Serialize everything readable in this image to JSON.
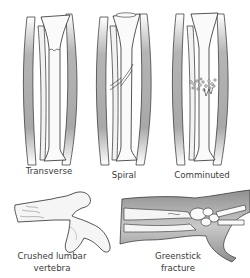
{
  "diagram": {
    "colors": {
      "muscle": "#8a8a8a",
      "muscle_light": "#e6e6e6",
      "bone": "#f7f7f7",
      "outline": "#2b2b2b",
      "text": "#3a3a3a"
    },
    "panels": [
      {
        "id": "transverse",
        "label": "Transverse"
      },
      {
        "id": "spiral",
        "label": "Spiral"
      },
      {
        "id": "comminuted",
        "label": "Comminuted"
      },
      {
        "id": "crushed-lumbar-vertebra",
        "label_line1": "Crushed lumbar",
        "label_line2": "vertebra"
      },
      {
        "id": "greenstick",
        "label_line1": "Greenstick",
        "label_line2": "fracture"
      }
    ]
  }
}
